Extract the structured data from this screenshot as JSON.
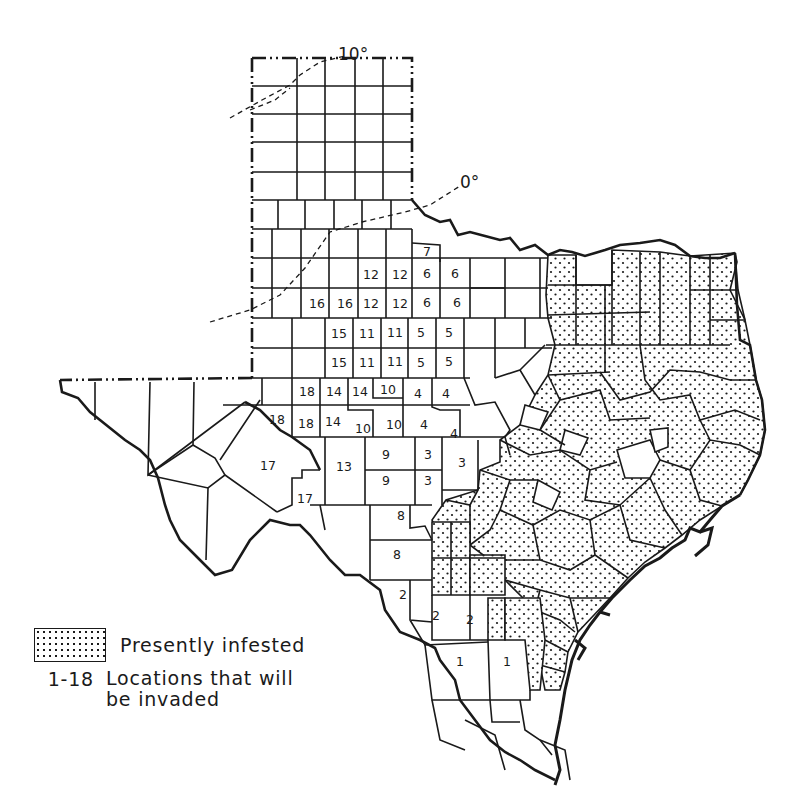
{
  "map": {
    "subject": "Texas counties",
    "isotherms": [
      {
        "label": "10°",
        "value": 10
      },
      {
        "label": "0°",
        "value": 0
      }
    ],
    "invasion_locations": [
      {
        "id": 1,
        "label": "1"
      },
      {
        "id": 2,
        "label": "2"
      },
      {
        "id": 3,
        "label": "3"
      },
      {
        "id": 4,
        "label": "4"
      },
      {
        "id": 5,
        "label": "5"
      },
      {
        "id": 6,
        "label": "6"
      },
      {
        "id": 7,
        "label": "7"
      },
      {
        "id": 8,
        "label": "8"
      },
      {
        "id": 9,
        "label": "9"
      },
      {
        "id": 10,
        "label": "10"
      },
      {
        "id": 11,
        "label": "11"
      },
      {
        "id": 12,
        "label": "12"
      },
      {
        "id": 13,
        "label": "13"
      },
      {
        "id": 14,
        "label": "14"
      },
      {
        "id": 15,
        "label": "15"
      },
      {
        "id": 16,
        "label": "16"
      },
      {
        "id": 17,
        "label": "17"
      },
      {
        "id": 18,
        "label": "18"
      }
    ],
    "labeled_counties": [
      {
        "n": "7",
        "x": 427,
        "y": 252
      },
      {
        "n": "12",
        "x": 371,
        "y": 275
      },
      {
        "n": "12",
        "x": 400,
        "y": 275
      },
      {
        "n": "6",
        "x": 427,
        "y": 274
      },
      {
        "n": "6",
        "x": 455,
        "y": 274
      },
      {
        "n": "16",
        "x": 317,
        "y": 304
      },
      {
        "n": "16",
        "x": 345,
        "y": 304
      },
      {
        "n": "12",
        "x": 371,
        "y": 304
      },
      {
        "n": "12",
        "x": 400,
        "y": 304
      },
      {
        "n": "6",
        "x": 427,
        "y": 303
      },
      {
        "n": "6",
        "x": 457,
        "y": 303
      },
      {
        "n": "15",
        "x": 339,
        "y": 334
      },
      {
        "n": "11",
        "x": 367,
        "y": 334
      },
      {
        "n": "11",
        "x": 395,
        "y": 333
      },
      {
        "n": "5",
        "x": 421,
        "y": 333
      },
      {
        "n": "5",
        "x": 449,
        "y": 333
      },
      {
        "n": "15",
        "x": 339,
        "y": 363
      },
      {
        "n": "11",
        "x": 367,
        "y": 363
      },
      {
        "n": "11",
        "x": 395,
        "y": 362
      },
      {
        "n": "5",
        "x": 421,
        "y": 363
      },
      {
        "n": "5",
        "x": 449,
        "y": 362
      },
      {
        "n": "18",
        "x": 307,
        "y": 392
      },
      {
        "n": "14",
        "x": 334,
        "y": 392
      },
      {
        "n": "14",
        "x": 360,
        "y": 392
      },
      {
        "n": "10",
        "x": 388,
        "y": 390
      },
      {
        "n": "4",
        "x": 418,
        "y": 394
      },
      {
        "n": "4",
        "x": 446,
        "y": 394
      },
      {
        "n": "18",
        "x": 277,
        "y": 420
      },
      {
        "n": "18",
        "x": 306,
        "y": 424
      },
      {
        "n": "14",
        "x": 333,
        "y": 422
      },
      {
        "n": "10",
        "x": 363,
        "y": 429
      },
      {
        "n": "10",
        "x": 394,
        "y": 425
      },
      {
        "n": "4",
        "x": 424,
        "y": 425
      },
      {
        "n": "4",
        "x": 454,
        "y": 434
      },
      {
        "n": "17",
        "x": 268,
        "y": 466
      },
      {
        "n": "13",
        "x": 344,
        "y": 467
      },
      {
        "n": "9",
        "x": 386,
        "y": 455
      },
      {
        "n": "3",
        "x": 428,
        "y": 455
      },
      {
        "n": "3",
        "x": 462,
        "y": 463
      },
      {
        "n": "9",
        "x": 386,
        "y": 481
      },
      {
        "n": "3",
        "x": 428,
        "y": 481
      },
      {
        "n": "17",
        "x": 305,
        "y": 499
      },
      {
        "n": "8",
        "x": 401,
        "y": 516
      },
      {
        "n": "8",
        "x": 397,
        "y": 555
      },
      {
        "n": "2",
        "x": 403,
        "y": 595
      },
      {
        "n": "2",
        "x": 436,
        "y": 616
      },
      {
        "n": "2",
        "x": 470,
        "y": 620
      },
      {
        "n": "1",
        "x": 460,
        "y": 662
      },
      {
        "n": "1",
        "x": 507,
        "y": 662
      }
    ]
  },
  "legend": {
    "infested_label": "Presently infested",
    "range_label": "1-18",
    "range_text_line1": "Locations that will",
    "range_text_line2": "be invaded"
  },
  "colors": {
    "ink": "#1a1a1a",
    "background": "#ffffff"
  }
}
